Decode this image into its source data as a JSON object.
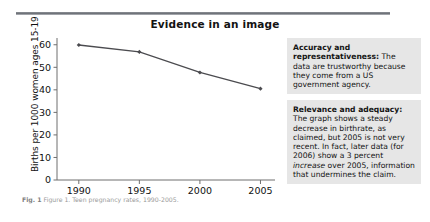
{
  "header": {
    "title": "Evidence in an image",
    "rule_color": "#7a7d83"
  },
  "figure": {
    "caption_label": "Fig. 1",
    "caption_text": "Figure 1. Teen pregnancy rates, 1990-2005."
  },
  "chart_data": {
    "type": "line",
    "title": "",
    "xlabel": "",
    "ylabel": "Births per 1000 women ages 15-19",
    "x": [
      1990,
      1995,
      2000,
      2005
    ],
    "xticklabels": [
      "1990",
      "1995",
      "2000",
      "2005"
    ],
    "values": [
      59.9,
      56.8,
      47.7,
      40.5
    ],
    "yticks": [
      0,
      10,
      20,
      30,
      40,
      50,
      60
    ],
    "yticklabels": [
      "0",
      "10",
      "20",
      "30",
      "40",
      "50",
      "60"
    ],
    "ylim": [
      0,
      63
    ],
    "xlim": [
      1988.2,
      2006.2
    ],
    "grid": false,
    "legend": false,
    "series_color": "#4b4b4f",
    "marker": "diamond"
  },
  "notes": [
    {
      "name": "accuracy-note",
      "lead": "Accuracy and representativeness:",
      "body": " The data are trustworthy because they come from a US government agency."
    },
    {
      "name": "relevance-note",
      "lead": "Relevance and adequacy:",
      "body_1": " The graph shows a steady decrease in birthrate, as claimed, but 2005 is not very recent. In fact, later data (for 2006) show a 3 percent ",
      "emphasis": "increase",
      "body_2": " over 2005, information that undermines the claim."
    }
  ]
}
